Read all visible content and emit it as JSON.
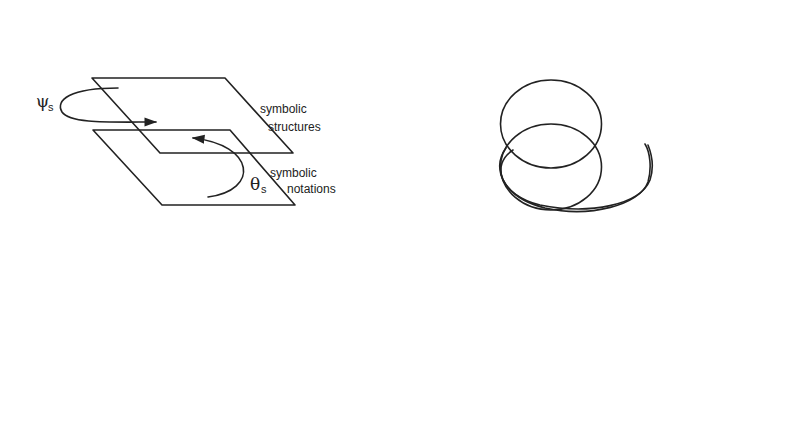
{
  "diagram": {
    "colors": {
      "stroke": "#222222",
      "background": "#ffffff"
    },
    "nodes": {
      "symbolic_structures": {
        "label_lines": [
          "symbolic",
          "structures"
        ]
      },
      "symbolic_notations": {
        "label_lines": [
          "symbolic",
          "notations"
        ]
      },
      "structures_abstract": {
        "label_lines": [
          "structures of",
          "abstract entities"
        ]
      },
      "abstract_entities": {
        "label_lines": [
          "abstract entities"
        ]
      },
      "structured_model": {
        "label_lines": [
          "structured model",
          "objects and events"
        ]
      },
      "concrete_model": {
        "label_lines": [
          "concrete model",
          "objects and events"
        ]
      },
      "structured_objects": {
        "label_lines": [
          "structured objects",
          "and events"
        ]
      },
      "concrete_objects": {
        "label_lines": [
          "concrete objects",
          "and events"
        ]
      }
    },
    "symbols": {
      "psi_s": {
        "main": "ψ",
        "sub": "s"
      },
      "theta_s": {
        "main": "θ",
        "sub": "s"
      },
      "mu_a": {
        "main": "μ",
        "sub": "a"
      },
      "theta_a": {
        "main": "θ",
        "sub": "a"
      },
      "mu_m_psi_m": {
        "main1": "μ",
        "sub1": "m",
        "eq": "=",
        "main2": "ψ",
        "sub2": "m"
      },
      "theta_m": {
        "main": "θ",
        "sub": "m"
      },
      "mu_c": {
        "main": "μ",
        "sub": "c"
      },
      "theta_c": {
        "main": "θ",
        "sub": "c"
      },
      "phi_sa": {
        "main": "ϕ",
        "sub": "sa"
      },
      "phi_sc": {
        "main": "ϕ",
        "sub": "sc"
      },
      "phi_ma": {
        "main": "ϕ",
        "sub": "ma"
      },
      "phi_mc": {
        "main": "ϕ",
        "sub": "mc"
      },
      "phi_sm": {
        "main": "ϕ",
        "sub": "sm"
      },
      "alpha": {
        "main": "α"
      }
    },
    "edges": [
      {
        "id": "phi_sa",
        "from": "symbolic_structures",
        "to": "structures_abstract"
      },
      {
        "id": "phi_sc",
        "from": "symbolic_structures",
        "to": "structured_objects"
      },
      {
        "id": "phi_ma",
        "from": "structured_model",
        "to": "abstract_entities"
      },
      {
        "id": "phi_mc",
        "from": "structured_model",
        "to": "structured_objects"
      },
      {
        "id": "phi_sm",
        "from": "symbolic_structures",
        "to": "structured_model"
      },
      {
        "id": "alpha",
        "from": "structured_objects",
        "to": "structures_abstract"
      }
    ]
  }
}
